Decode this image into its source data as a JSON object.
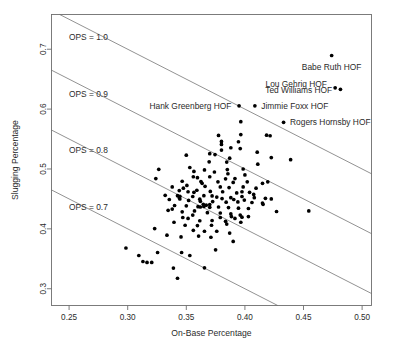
{
  "chart_data": {
    "type": "scatter",
    "title": "",
    "xlabel": "On-Base Percentage",
    "ylabel": "Slugging Percentage",
    "xlim": [
      0.235,
      0.508
    ],
    "ylim": [
      0.272,
      0.758
    ],
    "xticks": [
      0.25,
      0.3,
      0.35,
      0.4,
      0.45,
      0.5
    ],
    "xticklabels": [
      "0.25",
      "0.30",
      "0.35",
      "0.40",
      "0.45",
      "0.50"
    ],
    "yticks": [
      0.3,
      0.4,
      0.5,
      0.6,
      0.7
    ],
    "yticklabels": [
      "0.3",
      "0.4",
      "0.5",
      "0.6",
      "0.7"
    ],
    "grid": false,
    "legend": false,
    "reference_lines": [
      {
        "label": "OPS = 1.0",
        "ops": 1.0,
        "label_x": 0.2665,
        "label_y": 0.715
      },
      {
        "label": "OPS = 0.9",
        "ops": 0.9,
        "label_x": 0.2665,
        "label_y": 0.62
      },
      {
        "label": "OPS = 0.8",
        "ops": 0.8,
        "label_x": 0.2665,
        "label_y": 0.526
      },
      {
        "label": "OPS = 0.7",
        "ops": 0.7,
        "label_x": 0.2665,
        "label_y": 0.431
      }
    ],
    "annotations": [
      {
        "text": "Babe Ruth HOF",
        "x": 0.474,
        "y": 0.6895,
        "label_x": 0.474,
        "label_y": 0.67,
        "align": "middle"
      },
      {
        "text": "Lou Gehrig HOF",
        "x": 0.477,
        "y": 0.6355,
        "label_x": 0.47,
        "label_y": 0.642,
        "align": "end"
      },
      {
        "text": "Ted Williams HOF",
        "x": 0.4815,
        "y": 0.633,
        "label_x": 0.4745,
        "label_y": 0.6325,
        "align": "end"
      },
      {
        "text": "Hank Greenberg HOF",
        "x": 0.395,
        "y": 0.6055,
        "label_x": 0.3885,
        "label_y": 0.606,
        "align": "end"
      },
      {
        "text": "Jimmie Foxx HOF",
        "x": 0.4085,
        "y": 0.6055,
        "label_x": 0.414,
        "label_y": 0.606,
        "align": "start"
      },
      {
        "text": "Rogers Hornsby HOF",
        "x": 0.433,
        "y": 0.578,
        "label_x": 0.4385,
        "label_y": 0.5785,
        "align": "start"
      }
    ],
    "points": [
      [
        0.474,
        0.6895
      ],
      [
        0.477,
        0.6355
      ],
      [
        0.4815,
        0.633
      ],
      [
        0.395,
        0.6055
      ],
      [
        0.4085,
        0.6055
      ],
      [
        0.433,
        0.578
      ],
      [
        0.3965,
        0.579
      ],
      [
        0.3775,
        0.556
      ],
      [
        0.3965,
        0.5575
      ],
      [
        0.4185,
        0.5565
      ],
      [
        0.4215,
        0.5555
      ],
      [
        0.38,
        0.546
      ],
      [
        0.3945,
        0.5455
      ],
      [
        0.38,
        0.541
      ],
      [
        0.388,
        0.5355
      ],
      [
        0.396,
        0.534
      ],
      [
        0.38,
        0.5315
      ],
      [
        0.4105,
        0.528
      ],
      [
        0.35,
        0.523
      ],
      [
        0.3745,
        0.524
      ],
      [
        0.4225,
        0.519
      ],
      [
        0.439,
        0.5155
      ],
      [
        0.3695,
        0.512
      ],
      [
        0.411,
        0.508
      ],
      [
        0.353,
        0.5025
      ],
      [
        0.3265,
        0.4995
      ],
      [
        0.3655,
        0.4985
      ],
      [
        0.385,
        0.499
      ],
      [
        0.3565,
        0.496
      ],
      [
        0.374,
        0.495
      ],
      [
        0.3855,
        0.492
      ],
      [
        0.324,
        0.484
      ],
      [
        0.3595,
        0.4855
      ],
      [
        0.37,
        0.487
      ],
      [
        0.3835,
        0.4835
      ],
      [
        0.3465,
        0.4795
      ],
      [
        0.3625,
        0.479
      ],
      [
        0.377,
        0.4785
      ],
      [
        0.39,
        0.4775
      ],
      [
        0.402,
        0.4785
      ],
      [
        0.4195,
        0.4785
      ],
      [
        0.338,
        0.47
      ],
      [
        0.3505,
        0.4725
      ],
      [
        0.366,
        0.471
      ],
      [
        0.379,
        0.47
      ],
      [
        0.3865,
        0.469
      ],
      [
        0.3985,
        0.47
      ],
      [
        0.4095,
        0.468
      ],
      [
        0.344,
        0.464
      ],
      [
        0.359,
        0.4645
      ],
      [
        0.3705,
        0.4625
      ],
      [
        0.381,
        0.462
      ],
      [
        0.393,
        0.46
      ],
      [
        0.404,
        0.461
      ],
      [
        0.332,
        0.456
      ],
      [
        0.3425,
        0.4555
      ],
      [
        0.3445,
        0.4545
      ],
      [
        0.3555,
        0.454
      ],
      [
        0.365,
        0.4555
      ],
      [
        0.376,
        0.453
      ],
      [
        0.388,
        0.452
      ],
      [
        0.3975,
        0.454
      ],
      [
        0.408,
        0.452
      ],
      [
        0.4175,
        0.451
      ],
      [
        0.3355,
        0.449
      ],
      [
        0.352,
        0.4475
      ],
      [
        0.362,
        0.446
      ],
      [
        0.3725,
        0.4455
      ],
      [
        0.384,
        0.4445
      ],
      [
        0.394,
        0.445
      ],
      [
        0.406,
        0.444
      ],
      [
        0.415,
        0.443
      ],
      [
        0.4155,
        0.441
      ],
      [
        0.4545,
        0.43
      ],
      [
        0.34,
        0.439
      ],
      [
        0.35,
        0.4385
      ],
      [
        0.36,
        0.437
      ],
      [
        0.362,
        0.4365
      ],
      [
        0.365,
        0.4375
      ],
      [
        0.37,
        0.436
      ],
      [
        0.3775,
        0.4365
      ],
      [
        0.386,
        0.4355
      ],
      [
        0.3945,
        0.4345
      ],
      [
        0.403,
        0.434
      ],
      [
        0.427,
        0.429
      ],
      [
        0.3345,
        0.431
      ],
      [
        0.3465,
        0.4285
      ],
      [
        0.357,
        0.43
      ],
      [
        0.368,
        0.427
      ],
      [
        0.379,
        0.4265
      ],
      [
        0.388,
        0.425
      ],
      [
        0.396,
        0.423
      ],
      [
        0.3395,
        0.411
      ],
      [
        0.3515,
        0.4175
      ],
      [
        0.3615,
        0.4135
      ],
      [
        0.372,
        0.414
      ],
      [
        0.3835,
        0.4125
      ],
      [
        0.3915,
        0.4175
      ],
      [
        0.3975,
        0.4195
      ],
      [
        0.323,
        0.4005
      ],
      [
        0.356,
        0.3975
      ],
      [
        0.3655,
        0.396
      ],
      [
        0.376,
        0.396
      ],
      [
        0.387,
        0.393
      ],
      [
        0.3335,
        0.3895
      ],
      [
        0.3605,
        0.388
      ],
      [
        0.371,
        0.386
      ],
      [
        0.39,
        0.379
      ],
      [
        0.3455,
        0.3865
      ],
      [
        0.3255,
        0.3605
      ],
      [
        0.2985,
        0.368
      ],
      [
        0.3095,
        0.3555
      ],
      [
        0.313,
        0.3455
      ],
      [
        0.3165,
        0.344
      ],
      [
        0.3205,
        0.344
      ],
      [
        0.346,
        0.3605
      ],
      [
        0.353,
        0.3555
      ],
      [
        0.375,
        0.365
      ],
      [
        0.339,
        0.3345
      ],
      [
        0.3655,
        0.335
      ],
      [
        0.3425,
        0.3175
      ],
      [
        0.3975,
        0.462
      ],
      [
        0.4075,
        0.4575
      ],
      [
        0.4225,
        0.45
      ],
      [
        0.3845,
        0.5115
      ],
      [
        0.37,
        0.5255
      ],
      [
        0.356,
        0.487
      ],
      [
        0.3635,
        0.476
      ],
      [
        0.3915,
        0.484
      ],
      [
        0.4,
        0.49
      ],
      [
        0.415,
        0.476
      ],
      [
        0.3985,
        0.5
      ],
      [
        0.387,
        0.518
      ],
      [
        0.3565,
        0.461
      ],
      [
        0.3475,
        0.468
      ],
      [
        0.338,
        0.433
      ],
      [
        0.372,
        0.455
      ],
      [
        0.3805,
        0.4505
      ],
      [
        0.3905,
        0.449
      ],
      [
        0.3995,
        0.448
      ],
      [
        0.3615,
        0.4495
      ],
      [
        0.3515,
        0.462
      ],
      [
        0.344,
        0.452
      ],
      [
        0.3445,
        0.45
      ],
      [
        0.3645,
        0.441
      ],
      [
        0.367,
        0.4395
      ],
      [
        0.37,
        0.4405
      ],
      [
        0.3555,
        0.423
      ],
      [
        0.347,
        0.419
      ],
      [
        0.379,
        0.419
      ],
      [
        0.3885,
        0.4205
      ],
      [
        0.403,
        0.4205
      ],
      [
        0.3965,
        0.411
      ],
      [
        0.3845,
        0.408
      ],
      [
        0.3715,
        0.406
      ],
      [
        0.3595,
        0.4055
      ],
      [
        0.349,
        0.406
      ]
    ]
  },
  "colors": {
    "point": "#000000",
    "line": "#6e6e6e",
    "frame": "#6e6e6e",
    "text": "#2b2b2b",
    "background": "#ffffff"
  }
}
